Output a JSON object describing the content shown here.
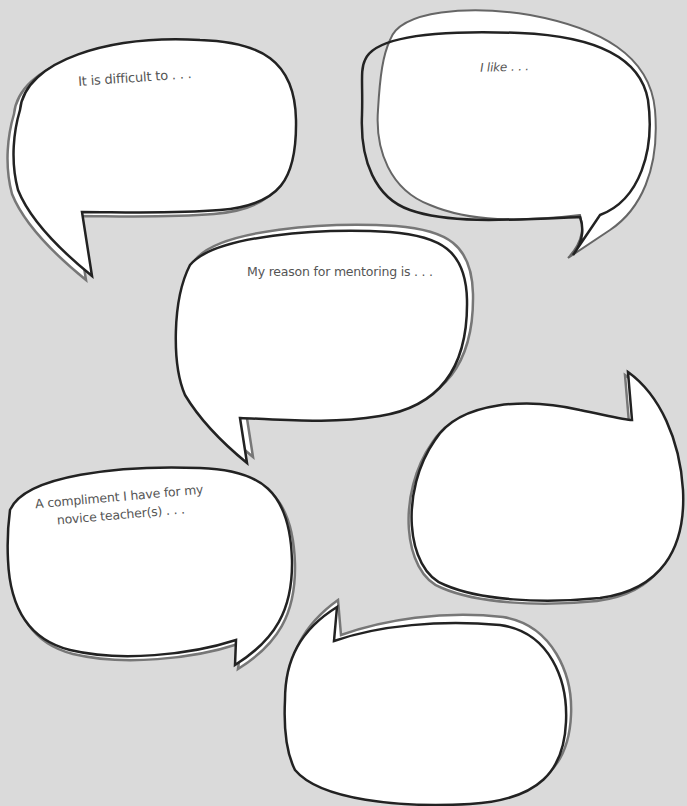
{
  "page": {
    "title_cut_off": "",
    "background_color": "#dadada",
    "bubble_fill": "#ffffff",
    "outline_color": "#222222",
    "shadow_outline_color": "#777777"
  },
  "bubbles": [
    {
      "id": "bubble-1",
      "prompt": "It is difficult to . . ."
    },
    {
      "id": "bubble-2",
      "prompt": "I like . . ."
    },
    {
      "id": "bubble-3",
      "prompt": "My reason for mentoring is . . ."
    },
    {
      "id": "bubble-4",
      "prompt": ""
    },
    {
      "id": "bubble-5",
      "prompt": "A compliment I have for my novice teacher(s) . . ."
    },
    {
      "id": "bubble-6",
      "prompt": ""
    }
  ]
}
